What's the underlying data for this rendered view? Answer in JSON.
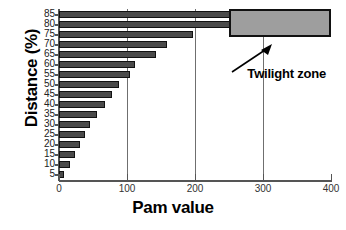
{
  "chart_data": {
    "type": "bar",
    "orientation": "horizontal",
    "title": "",
    "xlabel": "Pam value",
    "ylabel": "Distance (%)",
    "xlim": [
      0,
      400
    ],
    "xticks": [
      0,
      100,
      200,
      300,
      400
    ],
    "xticklabels": [
      "0",
      "100",
      "200",
      "300",
      "400"
    ],
    "grid": "vertical gridlines at 100, 200, 300",
    "legend": "none",
    "categories": [
      "85",
      "80",
      "75",
      "70",
      "65",
      "60",
      "55",
      "50",
      "45",
      "40",
      "35",
      "30",
      "25",
      "20",
      "15",
      "10",
      "5"
    ],
    "values": [
      255,
      255,
      197,
      159,
      143,
      112,
      104,
      88,
      78,
      67,
      56,
      46,
      38,
      31,
      24,
      16,
      7
    ],
    "bar_color": "#4a4a4a",
    "bar_edge_color": "#111111",
    "annotations": [
      {
        "label": "Twilight zone",
        "shape": "rectangle",
        "x_start": 250,
        "x_end": 400,
        "y_start": "85",
        "y_end": "75",
        "fill_color": "#9e9e9e",
        "edge_color": "#111111",
        "arrow": "from label up-right to rectangle"
      }
    ]
  },
  "axes": {
    "x_title": "Pam value",
    "y_title": "Distance (%)"
  },
  "annotation_text": {
    "twilight": "Twilight zone"
  }
}
